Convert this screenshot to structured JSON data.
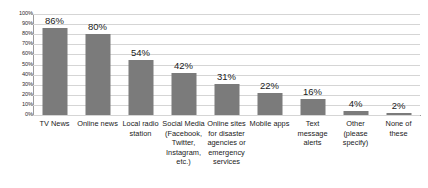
{
  "chart_data": {
    "type": "bar",
    "title": "",
    "subtitle": "",
    "xlabel": "",
    "ylabel": "",
    "ylim": [
      0,
      100
    ],
    "grid": true,
    "legend": "none",
    "orientation": "vertical",
    "bar_color": "#7b7b7b",
    "gridline_color": "#d5d5d5",
    "axis_color": "#9a9a9a",
    "value_suffix": "%",
    "categories": [
      "TV News",
      "Online news",
      "Local radio station",
      "Social Media (Facebook, Twitter, Instagram, etc.)",
      "Online sites for disaster agencies or emergency services",
      "Mobile apps",
      "Text message alerts",
      "Other (please specify)",
      "None of these"
    ],
    "values": [
      86,
      80,
      54,
      42,
      31,
      22,
      16,
      4,
      2
    ],
    "data_labels": [
      "86%",
      "80%",
      "54%",
      "42%",
      "31%",
      "22%",
      "16%",
      "4%",
      "2%"
    ],
    "ytick_values": [
      100,
      90,
      80,
      70,
      60,
      50,
      40,
      30,
      20,
      10,
      0
    ],
    "ytick_labels": [
      "100%",
      "90%",
      "80%",
      "70%",
      "60%",
      "50%",
      "40%",
      "30%",
      "20%",
      "10%",
      "0%"
    ]
  }
}
